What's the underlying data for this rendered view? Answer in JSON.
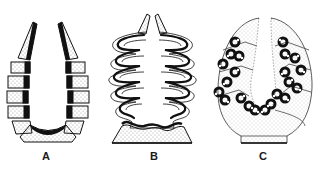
{
  "figure": {
    "panels": [
      {
        "id": "A",
        "label": "A",
        "description": "U-shaped row of dotted segments with dark inner band"
      },
      {
        "id": "B",
        "label": "B",
        "description": "Folded/convoluted segmented walls on a dotted trapezoid base"
      },
      {
        "id": "C",
        "label": "C",
        "description": "Oval dotted body with clustered dark ring structures"
      }
    ],
    "colors": {
      "ink": "#111111",
      "stipple": "#8a8a8a",
      "background": "#ffffff"
    }
  }
}
